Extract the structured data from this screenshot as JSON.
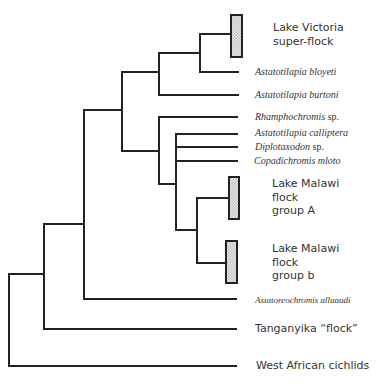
{
  "figure": {
    "type": "phylogenetic-tree",
    "line_color": "#222222",
    "clade_box_fill": "#d8d8d8",
    "taxa": [
      {
        "id": "victoria",
        "lines": [
          "Lake Victoria",
          "super-flock"
        ],
        "style": "clade-box"
      },
      {
        "id": "bloyeti",
        "genus": "Astatotilapia",
        "epithet": "bloyeti",
        "style": "italic"
      },
      {
        "id": "burtoni",
        "genus": "Astatotilapia",
        "epithet": "burtoni",
        "style": "italic"
      },
      {
        "id": "rhamphochromis",
        "genus": "Rhamphochromis",
        "epithet": "sp.",
        "style": "italic"
      },
      {
        "id": "calliptera",
        "genus": "Astatotilapia",
        "epithet": "calliptera",
        "style": "italic"
      },
      {
        "id": "diplotaxodon",
        "genus": "Diplotaxodon",
        "epithet": "sp.",
        "style": "italic"
      },
      {
        "id": "copadichromis",
        "genus": "Copadichromis",
        "epithet": "mloto",
        "style": "italic"
      },
      {
        "id": "malawi_a",
        "lines": [
          "Lake Malawi",
          "flock",
          "group A"
        ],
        "style": "clade-box"
      },
      {
        "id": "malawi_b",
        "lines": [
          "Lake Malawi",
          "flock",
          "group b"
        ],
        "style": "clade-box"
      },
      {
        "id": "alluaudi",
        "genus": "Astatoreochromis",
        "epithet": "alluaudi",
        "style": "italic"
      },
      {
        "id": "tanganyika",
        "lines": [
          "Tanganyika “flock”"
        ],
        "style": "plain"
      },
      {
        "id": "west_african",
        "lines": [
          "West African cichlids"
        ],
        "style": "plain"
      }
    ]
  }
}
